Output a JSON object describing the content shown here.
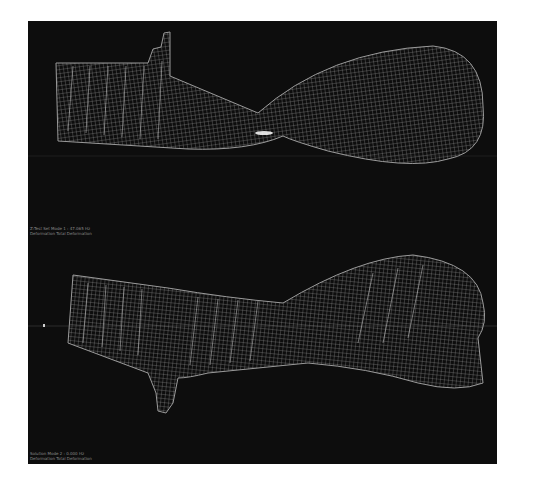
{
  "figure": {
    "background": "#0d0d0d",
    "mesh_color": "#bdbdbd",
    "views": [
      {
        "name": "top-view",
        "caption_line1": "Z:Test Set Mode 1 : 47.065 Hz",
        "caption_line2": "Deformation Total Deformation"
      },
      {
        "name": "bottom-view",
        "caption_line1": "Solution Mode 2 : 0.000 Hz",
        "caption_line2": "Deformation Total Deformation"
      }
    ]
  }
}
